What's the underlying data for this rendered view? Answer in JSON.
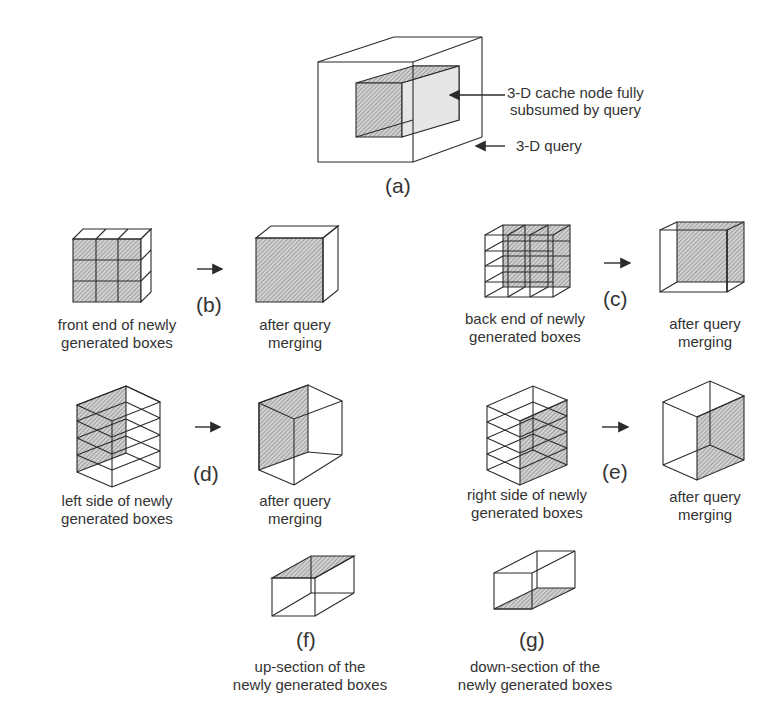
{
  "figure": {
    "panel_a": {
      "tag": "(a)",
      "annotations": {
        "cache_node_line1": "3-D cache node fully",
        "cache_node_line2": "subsumed by query",
        "query": "3-D query"
      }
    },
    "panel_b": {
      "tag": "(b)",
      "before_line1": "front end of newly",
      "before_line2": "generated boxes",
      "after_line1": "after query",
      "after_line2": "merging"
    },
    "panel_c": {
      "tag": "(c)",
      "before_line1": "back end of newly",
      "before_line2": "generated boxes",
      "after_line1": "after query",
      "after_line2": "merging"
    },
    "panel_d": {
      "tag": "(d)",
      "before_line1": "left side of newly",
      "before_line2": "generated boxes",
      "after_line1": "after query",
      "after_line2": "merging"
    },
    "panel_e": {
      "tag": "(e)",
      "before_line1": "right side of newly",
      "before_line2": "generated boxes",
      "after_line1": "after query",
      "after_line2": "merging"
    },
    "panel_f": {
      "tag": "(f)",
      "line1": "up-section of the",
      "line2": "newly generated boxes"
    },
    "panel_g": {
      "tag": "(g)",
      "line1": "down-section of the",
      "line2": "newly generated boxes"
    }
  },
  "colors": {
    "stroke": "#2b2b2b",
    "hatch_bg": "#cfcfcf",
    "hatch_line": "#7a7a7a"
  }
}
